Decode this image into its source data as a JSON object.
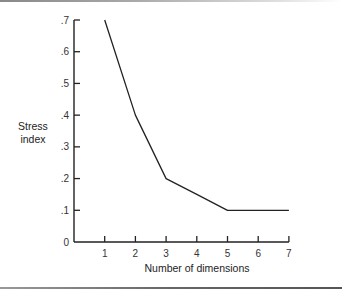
{
  "chart_data": {
    "type": "line",
    "title": "",
    "xlabel": "Number of dimensions",
    "ylabel": "Stress index",
    "ylabel_lines": [
      "Stress",
      "index"
    ],
    "x": [
      1,
      2,
      3,
      4,
      5,
      6,
      7
    ],
    "series": [
      {
        "name": "Stress",
        "values": [
          0.7,
          0.4,
          0.2,
          0.15,
          0.1,
          0.1,
          0.1
        ]
      }
    ],
    "xticks": [
      "1",
      "2",
      "3",
      "4",
      "5",
      "6",
      "7"
    ],
    "yticks": [
      "0",
      ".1",
      ".2",
      ".3",
      ".4",
      ".5",
      ".6",
      ".7"
    ],
    "xlim": [
      0,
      7
    ],
    "ylim": [
      0,
      0.7
    ],
    "grid": false,
    "legend": null
  }
}
